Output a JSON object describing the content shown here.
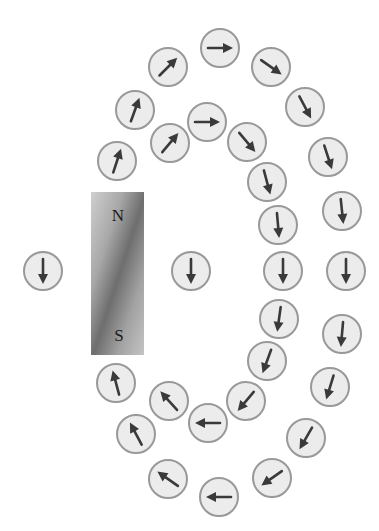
{
  "diagram": {
    "magnet": {
      "x": 91,
      "y": 192,
      "width": 53,
      "height": 163,
      "north_label": "N",
      "south_label": "S",
      "north_label_pos": [
        118,
        221
      ],
      "south_label_pos": [
        119,
        341
      ],
      "colors": {
        "light": "#cfcfcf",
        "mid": "#a2a2a2",
        "dark": "#6e6e6e"
      }
    },
    "compass_style": {
      "radius": 19,
      "fill": "#ececec",
      "stroke": "#999999",
      "stroke_width": 2,
      "needle_color": "#3a3a3a",
      "needle_half_length": 12
    },
    "compasses": [
      {
        "id": "c01",
        "cx": 43,
        "cy": 271,
        "bearing": 180
      },
      {
        "id": "c02",
        "cx": 191,
        "cy": 271,
        "bearing": 180
      },
      {
        "id": "c03",
        "cx": 117,
        "cy": 161,
        "bearing": 18
      },
      {
        "id": "c04",
        "cx": 135,
        "cy": 110,
        "bearing": 20
      },
      {
        "id": "c05",
        "cx": 168,
        "cy": 67,
        "bearing": 45
      },
      {
        "id": "c06",
        "cx": 220,
        "cy": 48,
        "bearing": 90
      },
      {
        "id": "c07",
        "cx": 271,
        "cy": 67,
        "bearing": 125
      },
      {
        "id": "c08",
        "cx": 305,
        "cy": 107,
        "bearing": 152
      },
      {
        "id": "c09",
        "cx": 328,
        "cy": 157,
        "bearing": 162
      },
      {
        "id": "c10",
        "cx": 342,
        "cy": 211,
        "bearing": 174
      },
      {
        "id": "c11",
        "cx": 346,
        "cy": 271,
        "bearing": 180
      },
      {
        "id": "c12",
        "cx": 342,
        "cy": 334,
        "bearing": 185
      },
      {
        "id": "c13",
        "cx": 330,
        "cy": 387,
        "bearing": 197
      },
      {
        "id": "c14",
        "cx": 306,
        "cy": 438,
        "bearing": 210
      },
      {
        "id": "c15",
        "cx": 272,
        "cy": 478,
        "bearing": 235
      },
      {
        "id": "c16",
        "cx": 219,
        "cy": 497,
        "bearing": 270
      },
      {
        "id": "c17",
        "cx": 168,
        "cy": 479,
        "bearing": 305
      },
      {
        "id": "c18",
        "cx": 136,
        "cy": 434,
        "bearing": 332
      },
      {
        "id": "c19",
        "cx": 116,
        "cy": 383,
        "bearing": 345
      },
      {
        "id": "c20",
        "cx": 170,
        "cy": 143,
        "bearing": 40
      },
      {
        "id": "c21",
        "cx": 207,
        "cy": 122,
        "bearing": 90
      },
      {
        "id": "c22",
        "cx": 247,
        "cy": 142,
        "bearing": 140
      },
      {
        "id": "c23",
        "cx": 267,
        "cy": 182,
        "bearing": 165
      },
      {
        "id": "c24",
        "cx": 278,
        "cy": 225,
        "bearing": 175
      },
      {
        "id": "c25",
        "cx": 283,
        "cy": 271,
        "bearing": 180
      },
      {
        "id": "c26",
        "cx": 279,
        "cy": 319,
        "bearing": 188
      },
      {
        "id": "c27",
        "cx": 267,
        "cy": 361,
        "bearing": 200
      },
      {
        "id": "c28",
        "cx": 246,
        "cy": 401,
        "bearing": 220
      },
      {
        "id": "c29",
        "cx": 208,
        "cy": 423,
        "bearing": 270
      },
      {
        "id": "c30",
        "cx": 169,
        "cy": 401,
        "bearing": 318
      }
    ]
  }
}
